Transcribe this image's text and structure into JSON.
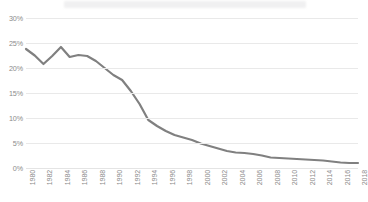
{
  "figure": {
    "title": "",
    "title_redacted": true,
    "background_color": "#ffffff"
  },
  "chart_data": {
    "type": "line",
    "title": "",
    "subtitle": "",
    "xlabel": "",
    "ylabel": "",
    "grid": true,
    "legend": false,
    "legend_position": "none",
    "line_color": "#808080",
    "line_width": 2.2,
    "xlim": [
      1980,
      2018
    ],
    "ylim": [
      0,
      30
    ],
    "ytick_labels": [
      "30%",
      "25%",
      "20%",
      "15%",
      "10%",
      "5%",
      "0%"
    ],
    "ytick_values": [
      30,
      25,
      20,
      15,
      10,
      5,
      0
    ],
    "xtick_labels": [
      "1980",
      "1982",
      "1984",
      "1986",
      "1988",
      "1990",
      "1992",
      "1994",
      "1996",
      "1998",
      "2000",
      "2002",
      "2004",
      "2006",
      "2008",
      "2010",
      "2012",
      "2014",
      "2016",
      "2018"
    ],
    "xtick_values": [
      1980,
      1982,
      1984,
      1986,
      1988,
      1990,
      1992,
      1994,
      1996,
      1998,
      2000,
      2002,
      2004,
      2006,
      2008,
      2010,
      2012,
      2014,
      2016,
      2018
    ],
    "x": [
      1980,
      1981,
      1982,
      1983,
      1984,
      1985,
      1986,
      1987,
      1988,
      1989,
      1990,
      1991,
      1992,
      1993,
      1994,
      1995,
      1996,
      1997,
      1998,
      1999,
      2000,
      2001,
      2002,
      2003,
      2004,
      2005,
      2006,
      2007,
      2008,
      2009,
      2010,
      2011,
      2012,
      2013,
      2014,
      2015,
      2016,
      2017,
      2018
    ],
    "values": [
      23.8,
      22.5,
      20.8,
      22.4,
      24.2,
      22.2,
      22.6,
      22.4,
      21.4,
      20.0,
      18.6,
      17.6,
      15.4,
      12.8,
      9.6,
      8.4,
      7.4,
      6.6,
      6.1,
      5.6,
      4.9,
      4.4,
      3.9,
      3.4,
      3.1,
      3.0,
      2.8,
      2.5,
      2.1,
      2.0,
      1.9,
      1.8,
      1.7,
      1.6,
      1.5,
      1.3,
      1.1,
      1.0,
      1.0
    ],
    "series": [
      {
        "name": "",
        "values": [
          23.8,
          22.5,
          20.8,
          22.4,
          24.2,
          22.2,
          22.6,
          22.4,
          21.4,
          20.0,
          18.6,
          17.6,
          15.4,
          12.8,
          9.6,
          8.4,
          7.4,
          6.6,
          6.1,
          5.6,
          4.9,
          4.4,
          3.9,
          3.4,
          3.1,
          3.0,
          2.8,
          2.5,
          2.1,
          2.0,
          1.9,
          1.8,
          1.7,
          1.6,
          1.5,
          1.3,
          1.1,
          1.0,
          1.0
        ]
      }
    ]
  },
  "colors": {
    "gridline": "#e9e9e9",
    "tick_label": "#8a8a8a",
    "line": "#808080",
    "title_bar": "#f0f0f1"
  }
}
